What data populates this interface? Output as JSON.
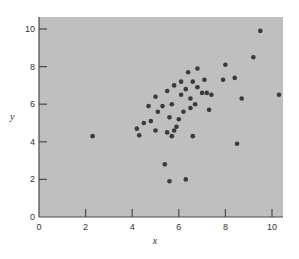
{
  "chart_data": {
    "type": "scatter",
    "title": "",
    "xlabel": "x",
    "ylabel": "y",
    "xlim": [
      0,
      10.6
    ],
    "ylim": [
      0,
      10.6
    ],
    "x_ticks": [
      0,
      2,
      4,
      6,
      8,
      10
    ],
    "y_ticks": [
      0,
      2,
      4,
      6,
      8,
      10
    ],
    "x_tick_labels": [
      "0",
      "2",
      "4",
      "6",
      "8",
      "10"
    ],
    "y_tick_labels": [
      "0",
      "2",
      "4",
      "6",
      "8",
      "10"
    ],
    "grid": false,
    "legend": null,
    "colors": {
      "background": "#bfbfbf",
      "points": "#3a3a3a",
      "axes": "#4a4a4a"
    },
    "points": [
      {
        "x": 2.3,
        "y": 4.3
      },
      {
        "x": 4.2,
        "y": 4.7
      },
      {
        "x": 4.3,
        "y": 4.35
      },
      {
        "x": 4.5,
        "y": 5.0
      },
      {
        "x": 4.7,
        "y": 5.9
      },
      {
        "x": 4.8,
        "y": 5.1
      },
      {
        "x": 5.0,
        "y": 6.4
      },
      {
        "x": 5.0,
        "y": 4.6
      },
      {
        "x": 5.1,
        "y": 5.6
      },
      {
        "x": 5.3,
        "y": 5.9
      },
      {
        "x": 5.4,
        "y": 2.8
      },
      {
        "x": 5.5,
        "y": 4.5
      },
      {
        "x": 5.5,
        "y": 6.7
      },
      {
        "x": 5.6,
        "y": 1.9
      },
      {
        "x": 5.6,
        "y": 5.3
      },
      {
        "x": 5.7,
        "y": 4.3
      },
      {
        "x": 5.7,
        "y": 6.0
      },
      {
        "x": 5.8,
        "y": 4.6
      },
      {
        "x": 5.8,
        "y": 7.0
      },
      {
        "x": 5.9,
        "y": 4.8
      },
      {
        "x": 6.0,
        "y": 5.2
      },
      {
        "x": 6.1,
        "y": 6.5
      },
      {
        "x": 6.1,
        "y": 7.2
      },
      {
        "x": 6.2,
        "y": 5.6
      },
      {
        "x": 6.3,
        "y": 6.8
      },
      {
        "x": 6.3,
        "y": 2.0
      },
      {
        "x": 6.4,
        "y": 7.7
      },
      {
        "x": 6.5,
        "y": 6.3
      },
      {
        "x": 6.5,
        "y": 5.8
      },
      {
        "x": 6.6,
        "y": 4.3
      },
      {
        "x": 6.6,
        "y": 7.2
      },
      {
        "x": 6.7,
        "y": 6.0
      },
      {
        "x": 6.8,
        "y": 7.9
      },
      {
        "x": 6.8,
        "y": 6.9
      },
      {
        "x": 7.0,
        "y": 6.6
      },
      {
        "x": 7.1,
        "y": 7.3
      },
      {
        "x": 7.2,
        "y": 6.6
      },
      {
        "x": 7.3,
        "y": 5.7
      },
      {
        "x": 7.4,
        "y": 6.5
      },
      {
        "x": 7.9,
        "y": 7.3
      },
      {
        "x": 8.0,
        "y": 8.1
      },
      {
        "x": 8.4,
        "y": 7.4
      },
      {
        "x": 8.5,
        "y": 3.9
      },
      {
        "x": 8.7,
        "y": 6.3
      },
      {
        "x": 9.2,
        "y": 8.5
      },
      {
        "x": 9.5,
        "y": 9.9
      },
      {
        "x": 10.3,
        "y": 6.5
      }
    ]
  }
}
